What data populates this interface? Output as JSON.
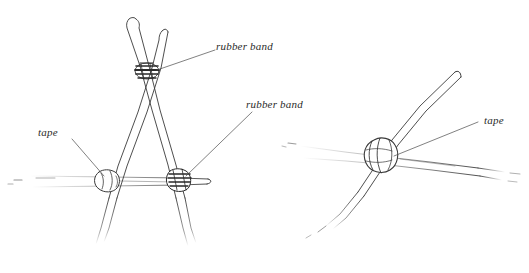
{
  "figure": {
    "background_color": "#ffffff",
    "ink_color": "#3a3a3a",
    "label_color": "#2b2b2b"
  },
  "labels": {
    "rubber_band_top": "rubber band",
    "rubber_band_right": "rubber band",
    "tape_left": "tape",
    "tape_right": "tape"
  },
  "diagrams": [
    {
      "name": "a-frame-assembly",
      "joints": [
        {
          "name": "apex-rubber-band-joint",
          "type": "rubber band",
          "x": 146,
          "y": 72
        },
        {
          "name": "left-tape-joint",
          "type": "tape",
          "x": 107,
          "y": 180
        },
        {
          "name": "right-rubber-band-joint",
          "type": "rubber band",
          "x": 178,
          "y": 180
        }
      ]
    },
    {
      "name": "tape-joint-closeup",
      "joints": [
        {
          "name": "center-tape-joint",
          "type": "tape",
          "x": 384,
          "y": 155
        }
      ]
    }
  ]
}
